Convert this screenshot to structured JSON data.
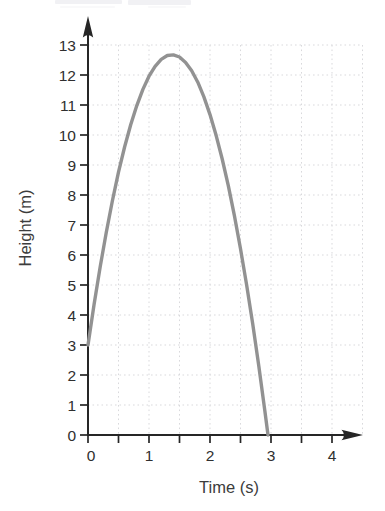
{
  "figure": {
    "background": "#ffffff"
  },
  "chart_data": {
    "type": "line",
    "title": "",
    "xlabel": "Time (s)",
    "ylabel": "Height (m)",
    "xlim": [
      0,
      4.5
    ],
    "ylim": [
      0,
      13.5
    ],
    "x_ticks": [
      0,
      0.5,
      1,
      1.5,
      2,
      2.5,
      3,
      3.5,
      4
    ],
    "x_tick_label_values": [
      0,
      1,
      2,
      3,
      4
    ],
    "y_ticks": [
      0,
      1,
      2,
      3,
      4,
      5,
      6,
      7,
      8,
      9,
      10,
      11,
      12,
      13
    ],
    "grid": {
      "visible": true,
      "style": "dotted",
      "x_step": 0.5,
      "y_step": 1,
      "x_min": 0.5,
      "x_max": 4.5,
      "y_min": 1,
      "y_max": 13
    },
    "legend": {
      "visible": false
    },
    "series": [
      {
        "name": "projectile-height",
        "x": [
          0,
          0.1,
          0.2,
          0.3,
          0.4,
          0.5,
          0.6,
          0.7,
          0.8,
          0.9,
          1.0,
          1.1,
          1.2,
          1.3,
          1.4,
          1.5,
          1.6,
          1.7,
          1.8,
          1.9,
          2.0,
          2.1,
          2.2,
          2.3,
          2.4,
          2.5,
          2.6,
          2.7,
          2.8,
          2.9,
          2.95
        ],
        "y": [
          3.0,
          4.36,
          5.61,
          6.76,
          7.81,
          8.76,
          9.6,
          10.34,
          10.98,
          11.52,
          11.96,
          12.29,
          12.52,
          12.65,
          12.67,
          12.6,
          12.42,
          12.14,
          11.76,
          11.27,
          10.68,
          9.99,
          9.2,
          8.31,
          7.31,
          6.21,
          5.01,
          3.71,
          2.3,
          0.79,
          0.0
        ],
        "start_point": [
          0,
          3
        ],
        "peak_point": [
          1.4,
          12.7
        ],
        "end_point": [
          2.95,
          0
        ]
      }
    ],
    "colors": {
      "curve": "#929292",
      "axis": "#262626",
      "grid": "#d9d9dc",
      "tick_label": "#2f2f2f",
      "axis_title": "#3c3c3c",
      "artifact": "#f1f1f4"
    }
  }
}
